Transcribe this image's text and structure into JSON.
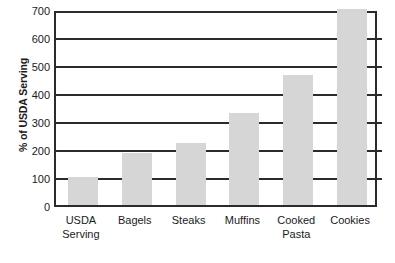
{
  "chart_data": {
    "type": "bar",
    "title": "",
    "subtitle": "",
    "xlabel": "",
    "ylabel": "% of USDA Serving",
    "ylim": [
      0,
      700
    ],
    "yticks": [
      0,
      100,
      200,
      300,
      400,
      500,
      600,
      700
    ],
    "ytick_labels": [
      "0",
      "100",
      "200",
      "300",
      "400",
      "500",
      "600",
      "700"
    ],
    "grid": "horizontal",
    "legend": "none",
    "bar_color": "#d6d6d6",
    "axis_color": "#2b2b2b",
    "categories": [
      "USDA Serving",
      "Bagels",
      "Steaks",
      "Muffins",
      "Cooked Pasta",
      "Cookies"
    ],
    "category_lines": [
      [
        "USDA",
        "Serving"
      ],
      [
        "Bagels",
        ""
      ],
      [
        "Steaks",
        ""
      ],
      [
        "Muffins",
        ""
      ],
      [
        "Cooked",
        "Pasta"
      ],
      [
        "Cookies",
        ""
      ]
    ],
    "values": [
      100,
      185,
      222,
      330,
      465,
      700
    ]
  },
  "bleed_through": {
    "line1": "Larger Portions Increase Eating?",
    "line2": "servings, other than pure liquids, standard sizes",
    "line3": "consumer portions at chains are larger",
    "line4": "other than pure liquids, standard serving",
    "line5": "Larger Portions",
    "line6": "a portion of pasta or rice"
  }
}
